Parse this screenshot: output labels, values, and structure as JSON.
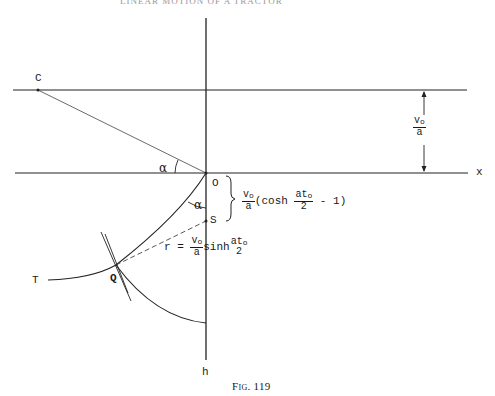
{
  "header": {
    "running_head": "LINEAR MOTION OF A TRACTOR"
  },
  "figure": {
    "caption": "Fig. 119",
    "points": {
      "C": "C",
      "O": "O",
      "S": "S",
      "Q": "Q",
      "T": "T"
    },
    "axes": {
      "x": "x",
      "h": "h"
    },
    "angles": {
      "alpha_top": "α",
      "alpha_bottom": "α"
    },
    "dimension": {
      "num": "v",
      "num_sub": "o",
      "den": "a"
    },
    "brace_expr": {
      "frac1_num": "v",
      "frac1_sub": "o",
      "frac1_den": "a",
      "cosh_open": "(cosh ",
      "frac2_num": "at",
      "frac2_sub": "o",
      "frac2_den": "2",
      "tail": " - 1)"
    },
    "radius_expr": {
      "lhs": "r = ",
      "frac1_num": "v",
      "frac1_sub": "o",
      "frac1_den": "a",
      "func": "sinh",
      "frac2_num": "at",
      "frac2_sub": "o",
      "frac2_den": "2"
    }
  }
}
